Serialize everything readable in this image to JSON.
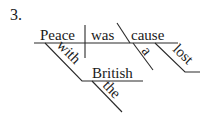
{
  "exercise_number": "3.",
  "diagram": {
    "type": "sentence-diagram",
    "subject": "Peace",
    "verb": "was",
    "predicate_nominative": "cause",
    "modifiers": {
      "subject_phrase_preposition": "with",
      "subject_phrase_object": "British",
      "object_article": "the",
      "pn_article": "a",
      "pn_adjective": "lost"
    }
  }
}
